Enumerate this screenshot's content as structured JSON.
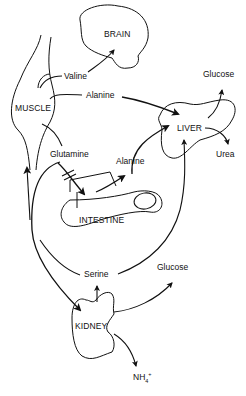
{
  "organs": {
    "brain": "BRAIN",
    "muscle": "MUSCLE",
    "liver": "LIVER",
    "intestine": "INTESTINE",
    "kidney": "KIDNEY"
  },
  "metabolites": {
    "valine": "Valine",
    "alanine_muscle": "Alanine",
    "glutamine": "Glutamine",
    "alanine_intestine": "Alanine",
    "glucose_liver": "Glucose",
    "urea": "Urea",
    "serine": "Serine",
    "glucose_kidney": "Glucose",
    "nh4_base": "NH",
    "nh4_sub": "4",
    "nh4_sup": "+"
  },
  "colors": {
    "stroke": "#111111",
    "background": "#ffffff"
  }
}
